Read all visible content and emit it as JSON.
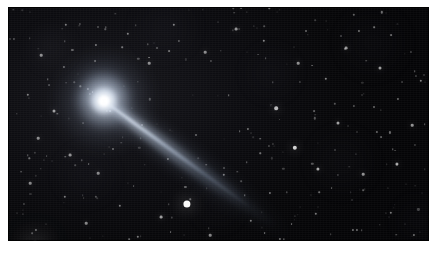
{
  "image": {
    "subject": "comet",
    "type": "astrophotograph",
    "caption": "",
    "frame": {
      "border_color": "#ffffff",
      "plate_color": "#050507",
      "left": 8,
      "top": 7,
      "width": 421,
      "height": 234
    }
  },
  "palette": {
    "sky_dark": "#050507",
    "sky_mid": "#0b0b0f",
    "sky_light": "#17171c",
    "star_white": "#ffffff",
    "coma_core": "#ffffff",
    "coma_glow": "#dfe3ea",
    "tail_blue": "#b9c6d8",
    "page_white": "#ffffff"
  },
  "comet": {
    "label": "comet-nucleus",
    "core": {
      "x": 96,
      "y": 94
    },
    "coma": {
      "radius_inner": 7,
      "radius_outer": 30,
      "brightness": 1.0
    },
    "fan": {
      "label": "dust-fan",
      "direction_deg": 8,
      "length": 62,
      "spread_deg": 34
    },
    "tail": {
      "label": "ion-tail",
      "angle_deg": 36,
      "length": 232,
      "start": {
        "x": 100,
        "y": 97
      },
      "end": {
        "x": 288,
        "y": 193
      },
      "width_near": 5,
      "width_far": 12
    }
  },
  "stars": [
    {
      "x": 27,
      "y": 239,
      "r": 5.5,
      "b": 1.0
    },
    {
      "x": 179,
      "y": 197,
      "r": 3.6,
      "b": 0.98
    },
    {
      "x": 153,
      "y": 210,
      "r": 1.4,
      "b": 0.6
    },
    {
      "x": 287,
      "y": 141,
      "r": 2.2,
      "b": 0.82
    },
    {
      "x": 268,
      "y": 101,
      "r": 1.8,
      "b": 0.72
    },
    {
      "x": 330,
      "y": 116,
      "r": 1.5,
      "b": 0.62
    },
    {
      "x": 310,
      "y": 162,
      "r": 1.6,
      "b": 0.66
    },
    {
      "x": 355,
      "y": 167,
      "r": 1.3,
      "b": 0.55
    },
    {
      "x": 389,
      "y": 157,
      "r": 1.6,
      "b": 0.64
    },
    {
      "x": 404,
      "y": 118,
      "r": 1.3,
      "b": 0.56
    },
    {
      "x": 413,
      "y": 74,
      "r": 1.2,
      "b": 0.5
    },
    {
      "x": 372,
      "y": 61,
      "r": 1.5,
      "b": 0.6
    },
    {
      "x": 338,
      "y": 41,
      "r": 1.4,
      "b": 0.58
    },
    {
      "x": 318,
      "y": 72,
      "r": 1.2,
      "b": 0.5
    },
    {
      "x": 290,
      "y": 56,
      "r": 1.3,
      "b": 0.54
    },
    {
      "x": 256,
      "y": 34,
      "r": 1.2,
      "b": 0.5
    },
    {
      "x": 228,
      "y": 22,
      "r": 1.4,
      "b": 0.56
    },
    {
      "x": 197,
      "y": 45,
      "r": 1.3,
      "b": 0.52
    },
    {
      "x": 166,
      "y": 18,
      "r": 1.2,
      "b": 0.48
    },
    {
      "x": 141,
      "y": 56,
      "r": 1.3,
      "b": 0.52
    },
    {
      "x": 120,
      "y": 27,
      "r": 1.2,
      "b": 0.48
    },
    {
      "x": 88,
      "y": 38,
      "r": 1.1,
      "b": 0.44
    },
    {
      "x": 58,
      "y": 18,
      "r": 1.2,
      "b": 0.46
    },
    {
      "x": 33,
      "y": 48,
      "r": 1.3,
      "b": 0.52
    },
    {
      "x": 20,
      "y": 88,
      "r": 1.2,
      "b": 0.48
    },
    {
      "x": 46,
      "y": 104,
      "r": 1.5,
      "b": 0.6
    },
    {
      "x": 30,
      "y": 131,
      "r": 1.3,
      "b": 0.52
    },
    {
      "x": 62,
      "y": 148,
      "r": 1.4,
      "b": 0.55
    },
    {
      "x": 22,
      "y": 176,
      "r": 1.3,
      "b": 0.5
    },
    {
      "x": 57,
      "y": 190,
      "r": 1.2,
      "b": 0.46
    },
    {
      "x": 90,
      "y": 166,
      "r": 1.3,
      "b": 0.5
    },
    {
      "x": 112,
      "y": 199,
      "r": 1.2,
      "b": 0.46
    },
    {
      "x": 78,
      "y": 216,
      "r": 1.3,
      "b": 0.5
    },
    {
      "x": 130,
      "y": 230,
      "r": 1.2,
      "b": 0.46
    },
    {
      "x": 202,
      "y": 228,
      "r": 1.3,
      "b": 0.5
    },
    {
      "x": 243,
      "y": 214,
      "r": 1.2,
      "b": 0.46
    },
    {
      "x": 272,
      "y": 232,
      "r": 1.1,
      "b": 0.42
    },
    {
      "x": 308,
      "y": 207,
      "r": 1.2,
      "b": 0.46
    },
    {
      "x": 345,
      "y": 223,
      "r": 1.1,
      "b": 0.42
    },
    {
      "x": 383,
      "y": 206,
      "r": 1.2,
      "b": 0.46
    },
    {
      "x": 406,
      "y": 228,
      "r": 1.1,
      "b": 0.42
    },
    {
      "x": 216,
      "y": 168,
      "r": 1.2,
      "b": 0.46
    },
    {
      "x": 240,
      "y": 122,
      "r": 1.1,
      "b": 0.42
    },
    {
      "x": 188,
      "y": 128,
      "r": 1.0,
      "b": 0.38
    },
    {
      "x": 160,
      "y": 152,
      "r": 1.1,
      "b": 0.4
    },
    {
      "x": 134,
      "y": 118,
      "r": 1.0,
      "b": 0.38
    },
    {
      "x": 105,
      "y": 142,
      "r": 1.0,
      "b": 0.38
    },
    {
      "x": 262,
      "y": 186,
      "r": 1.1,
      "b": 0.42
    },
    {
      "x": 366,
      "y": 100,
      "r": 1.0,
      "b": 0.38
    },
    {
      "x": 298,
      "y": 24,
      "r": 1.0,
      "b": 0.38
    }
  ],
  "faint_star_count": 240
}
